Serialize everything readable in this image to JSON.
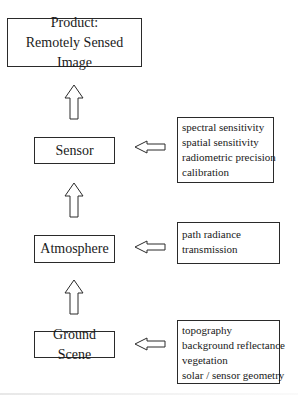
{
  "diagram": {
    "type": "flowchart",
    "direction": "bottom-to-top",
    "product": {
      "line1": "Product:",
      "line2": "Remotely Sensed Image"
    },
    "stages": [
      {
        "id": "sensor",
        "label": "Sensor",
        "factors": [
          "spectral sensitivity",
          "spatial sensitivity",
          "radiometric precision",
          "calibration"
        ]
      },
      {
        "id": "atmosphere",
        "label": "Atmosphere",
        "factors": [
          "path radiance",
          "transmission"
        ]
      },
      {
        "id": "ground-scene",
        "label": "Ground Scene",
        "factors": [
          "topography",
          "background reflectance",
          "vegetation",
          "solar / sensor geometry"
        ]
      }
    ],
    "edges": [
      {
        "from": "ground-scene",
        "to": "atmosphere",
        "style": "hollow-arrow-up"
      },
      {
        "from": "atmosphere",
        "to": "sensor",
        "style": "hollow-arrow-up"
      },
      {
        "from": "sensor",
        "to": "product",
        "style": "hollow-arrow-up"
      },
      {
        "from": "sensor-factors",
        "to": "sensor",
        "style": "hollow-arrow-left"
      },
      {
        "from": "atmosphere-factors",
        "to": "atmosphere",
        "style": "hollow-arrow-left"
      },
      {
        "from": "ground-scene-factors",
        "to": "ground-scene",
        "style": "hollow-arrow-left"
      }
    ],
    "colors": {
      "stroke": "#2a2a2a",
      "text": "#1a1a1a",
      "background": "#ffffff"
    }
  }
}
